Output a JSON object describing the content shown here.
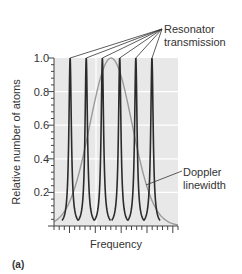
{
  "figure": {
    "panel_label": "(a)",
    "xlabel": "Frequency",
    "ylabel": "Relative number of atoms",
    "yticks": [
      "1.0",
      "0.8",
      "0.6",
      "0.4",
      "0.2"
    ],
    "annotations": {
      "resonator_line1": "Resonator",
      "resonator_line2": "transmission",
      "doppler_line1": "Doppler",
      "doppler_line2": "linewidth"
    }
  },
  "colors": {
    "plot_background": "#e8e8e8",
    "gridline": "#ffffff",
    "resonator_curve": "#2b2b2b",
    "doppler_curve": "#999999",
    "text": "#333333"
  },
  "chart_data": {
    "type": "line",
    "title": "",
    "xlabel": "Frequency",
    "ylabel": "Relative number of atoms",
    "ylim": [
      0,
      1.0
    ],
    "yticks": [
      0.2,
      0.4,
      0.6,
      0.8,
      1.0
    ],
    "grid": true,
    "series": [
      {
        "name": "Resonator transmission",
        "description": "Six narrow, equally spaced transmission peaks of height 1.0",
        "peak_positions_relative": [
          0.13,
          0.26,
          0.39,
          0.53,
          0.66,
          0.79
        ],
        "peak_height": 1.0
      },
      {
        "name": "Doppler linewidth",
        "description": "Broad Gaussian profile centered between the 3rd and 4th resonator peaks",
        "center_relative": 0.46,
        "peak_height": 1.0
      }
    ],
    "annotations": [
      "Resonator transmission",
      "Doppler linewidth"
    ],
    "panel_label": "(a)"
  }
}
